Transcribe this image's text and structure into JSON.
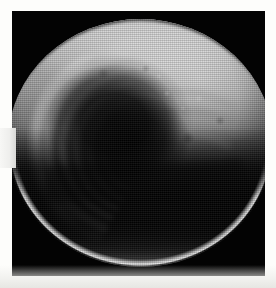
{
  "image": {
    "kind": "astronomical-photograph",
    "subject": "planetary disk",
    "color_mode": "grayscale",
    "alt_text": "Grayscale telescopic image of a planetary disk showing a bright northern hemisphere with concentric spiral cloud arcs around a dark central vortex, and a heavily shadowed southern hemisphere bounded by a thin bright limb arc.",
    "caption": ""
  },
  "canvas": {
    "width_px": 276,
    "height_px": 288,
    "paper_color": "#fdfdfb",
    "paper_bottom_tint": "#e8e8e4"
  },
  "plate": {
    "name": "image-plate",
    "background_color": "#030303",
    "left_px": 12,
    "top_px": 11,
    "width_px": 253,
    "height_px": 265
  },
  "disk": {
    "name": "planetary-disk",
    "center_x_px": 132,
    "center_y_px": 143,
    "diameter_px": 248,
    "top_px": 19,
    "bottom_px": 266,
    "bright_limb_color": "#ffffff",
    "highlight_color": "#c9c9c9",
    "shadow_color": "#121212"
  },
  "features": [
    {
      "name": "northern-bright-hemisphere",
      "label": "bright northern hemisphere",
      "tone": "light gray",
      "hex": "#bdbdbd"
    },
    {
      "name": "spiral-cloud-arcs",
      "label": "concentric spiral cloud bands",
      "tone": "mid gray",
      "hex": "#8a8a8a",
      "arc_count": 5,
      "quadrant": "upper-left"
    },
    {
      "name": "central-dark-vortex",
      "label": "dark central vortex core",
      "tone": "near black",
      "hex": "#101010"
    },
    {
      "name": "northeast-bright-band",
      "label": "bright mottled cloud band",
      "tone": "bright gray",
      "hex": "#d6d6d6",
      "quadrant": "upper-right"
    },
    {
      "name": "southern-shadowed-hemisphere",
      "label": "shadowed southern hemisphere",
      "tone": "black",
      "hex": "#0d0d0d"
    },
    {
      "name": "bottom-limb-arc",
      "label": "bright crescent limb arc",
      "tone": "white",
      "hex": "#f4f4f4"
    },
    {
      "name": "top-limb-rim",
      "label": "dark rim at upper limb",
      "tone": "dark gray",
      "hex": "#2a2a2a"
    }
  ]
}
